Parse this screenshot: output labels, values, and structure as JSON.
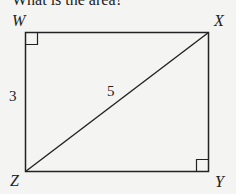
{
  "question": {
    "text": "What is the area?"
  },
  "diagram": {
    "shape": "rectangle",
    "vertices": {
      "top_left": "W",
      "top_right": "X",
      "bottom_right": "Y",
      "bottom_left": "Z"
    },
    "side_label": "3",
    "side_label_segment": "WZ",
    "diagonal_label": "5",
    "diagonal_segment": "ZX",
    "right_angle_markers": [
      "W",
      "Y"
    ],
    "colors": {
      "stroke": "#222222",
      "background": "#f4f4f2"
    }
  }
}
